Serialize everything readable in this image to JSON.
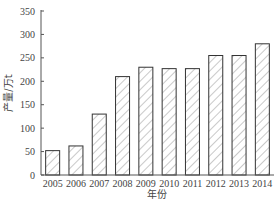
{
  "chart_data": {
    "type": "bar",
    "title": "",
    "xlabel": "年份",
    "ylabel": "产量/万t",
    "ylim": [
      0,
      350
    ],
    "yticks": [
      0,
      50,
      100,
      150,
      200,
      250,
      300,
      350
    ],
    "grid": false,
    "legend": null,
    "bar_fill": "diagonal-hatch",
    "categories": [
      "2005",
      "2006",
      "2007",
      "2008",
      "2009",
      "2010",
      "2011",
      "2012",
      "2013",
      "2014"
    ],
    "values": [
      52,
      62,
      130,
      210,
      230,
      227,
      227,
      255,
      255,
      280
    ]
  },
  "colors": {
    "axis": "#555555",
    "bar_edge": "#333333",
    "hatch": "#777777",
    "text": "#444444"
  }
}
